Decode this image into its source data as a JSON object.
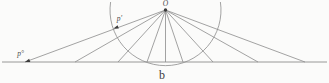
{
  "figure": {
    "caption": "b",
    "labels": {
      "apex": "O",
      "arc_point": "p′",
      "ground_point": "p°"
    },
    "colors": {
      "background": "#fbfbfa",
      "line": "#8c8c8c",
      "accent_dark": "#3c3c3c",
      "text": "#4a4a4a"
    },
    "geometry": {
      "width": 329,
      "height": 83,
      "apex": [
        165.5,
        10
      ],
      "apex_dot_radius": 1.7,
      "ground_y": 62,
      "ground_x_start": 2,
      "ground_x_end": 327,
      "circle_radius": 55.5,
      "arc_top_y": 2,
      "ray_ground_x": [
        25,
        75,
        118,
        147,
        165.5,
        183,
        213,
        258,
        305
      ],
      "arrows": [
        {
          "tip": [
            25,
            62
          ]
        },
        {
          "tip": [
            113.5,
            28.5
          ]
        }
      ],
      "arrow_direction": [
        -0.938,
        0.347
      ],
      "arrow_size": {
        "length": 5,
        "halfwidth": 1.7
      },
      "label_positions": {
        "apex": [
          165.5,
          4
        ],
        "arc_point": [
          119.5,
          19
        ],
        "ground_point": [
          20.5,
          54
        ],
        "caption": [
          162,
          75
        ]
      }
    }
  }
}
